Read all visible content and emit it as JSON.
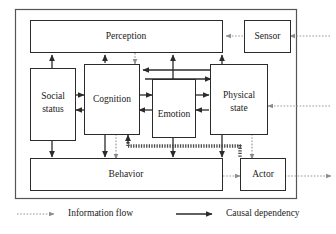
{
  "figure": {
    "nodes": [
      {
        "id": "perception",
        "label": "Perception"
      },
      {
        "id": "sensor",
        "label": "Sensor"
      },
      {
        "id": "social_status",
        "label": "Social\nstatus",
        "line1": "Social",
        "line2": "status"
      },
      {
        "id": "cognition",
        "label": "Cognition"
      },
      {
        "id": "emotion",
        "label": "Emotion"
      },
      {
        "id": "physical_state",
        "label": "Physical\nstate",
        "line1": "Physical",
        "line2": "state"
      },
      {
        "id": "behavior",
        "label": "Behavior"
      },
      {
        "id": "actor",
        "label": "Actor"
      }
    ],
    "legend": [
      {
        "id": "information-flow",
        "label": "Information flow",
        "style": "dotted",
        "color": "#9a9a9a"
      },
      {
        "id": "causal-dependency",
        "label": "Causal dependency",
        "style": "solid",
        "color": "#2b2b2b"
      }
    ],
    "colors": {
      "node_stroke": "#2b2b2b",
      "outer_stroke": "#555555",
      "solid_arrow": "#2b2b2b",
      "dotted_arrow": "#9a9a9a",
      "hatched_arrow": "#4a4a4a",
      "background": "#ffffff"
    }
  }
}
